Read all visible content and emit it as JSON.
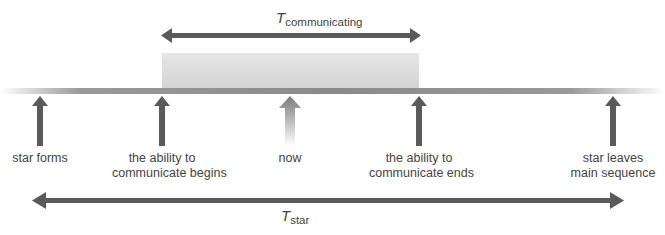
{
  "diagram": {
    "type": "timeline",
    "colors": {
      "arrow": "#5a5a5a",
      "timeline_bar": "#8a8a8a",
      "window_fill": "#dcdcdc",
      "text": "#444444"
    },
    "top_span": {
      "symbol": "T",
      "subscript": "communicating"
    },
    "bottom_span": {
      "symbol": "T",
      "subscript": "star"
    },
    "events": [
      {
        "id": "star-forms",
        "label_lines": [
          "star forms",
          ""
        ]
      },
      {
        "id": "ability-begins",
        "label_lines": [
          "the ability to",
          "communicate begins"
        ]
      },
      {
        "id": "now",
        "label_lines": [
          "now",
          ""
        ]
      },
      {
        "id": "ability-ends",
        "label_lines": [
          "the ability to",
          "communicate ends"
        ]
      },
      {
        "id": "star-leaves",
        "label_lines": [
          "star leaves",
          "main sequence"
        ]
      }
    ]
  }
}
